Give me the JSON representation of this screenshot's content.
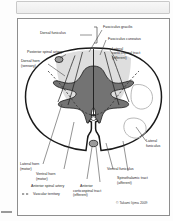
{
  "figure": {
    "title_absent": true,
    "copyright": "© Takami Iijima 2009",
    "legend": {
      "marker": "dashed-line",
      "label": "Vascular territory"
    },
    "labels": {
      "dorsal_funiculus": "Dorsal funiculus",
      "fasciculus_gracilis": "Fasciculus gracilis",
      "fasciculus_cuneatus": "Fasciculus cuneatus",
      "lateral_corticospinal_tract_l1": "Lateral",
      "lateral_corticospinal_tract_l2": "corticospinal tract",
      "lateral_corticospinal_tract_l3": "(efferent)",
      "posterior_spinal_artery": "Posterior spinal artery",
      "dorsal_horn_l1": "Dorsal horn",
      "dorsal_horn_l2": "(sensory)",
      "lateral_funiculus_l1": "Lateral",
      "lateral_funiculus_l2": "funiculus",
      "lateral_horn_l1": "Lateral horn",
      "lateral_horn_l2": "(motor)",
      "ventral_horn_l1": "Ventral horn",
      "ventral_horn_l2": "(motor)",
      "anterior_spinal_artery": "Anterior spinal artery",
      "ventral_funiculus": "Ventral funiculus",
      "spinothalamic_tract_l1": "Spinothalamic tract",
      "spinothalamic_tract_l2": "(afferent)",
      "anterior_corticospinal_tract_l1": "Anterior",
      "anterior_corticospinal_tract_l2": "corticospinal tract",
      "anterior_corticospinal_tract_l3": "(efferent)"
    },
    "colors": {
      "outline": "#1a1a1a",
      "white_matter": "#ffffff",
      "gray_matter": "#7a7a7a",
      "dorsal_funiculus_fill": "#dcdcdc",
      "artery_fill": "#9b9b9b",
      "frame_border": "#8e8e8e",
      "text": "#262626",
      "vascular_dashed": "#333333"
    }
  }
}
